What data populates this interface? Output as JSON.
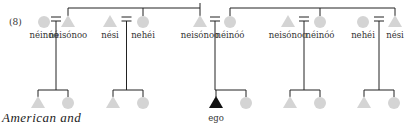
{
  "diagram": {
    "number_label": "(8)",
    "caption": "American and",
    "ego_label": "ego",
    "colors": {
      "symbol": "#d4d4d4",
      "ego": "#111111",
      "line": "#222222"
    },
    "couples": [
      {
        "x": 98,
        "left": {
          "shape": "circle",
          "x": 44,
          "label": "néinóó"
        },
        "right": {
          "shape": "triangle",
          "x": 68,
          "label": "neisónoo"
        }
      },
      {
        "x": 120,
        "left": {
          "shape": "triangle",
          "x": 110,
          "label": "nési"
        },
        "right": {
          "shape": "circle",
          "x": 143,
          "label": "nehéi"
        }
      },
      {
        "x": 216,
        "left": {
          "shape": "triangle",
          "x": 200,
          "label": "neisónoo"
        },
        "right": {
          "shape": "circle",
          "x": 230,
          "label": "néinóó"
        }
      },
      {
        "x": 305,
        "left": {
          "shape": "triangle",
          "x": 288,
          "label": "neisónoo"
        },
        "right": {
          "shape": "circle",
          "x": 320,
          "label": "néinóó"
        }
      },
      {
        "x": 380,
        "left": {
          "shape": "circle",
          "x": 363,
          "label": "nehéi"
        },
        "right": {
          "shape": "triangle",
          "x": 395,
          "label": "nési"
        }
      }
    ],
    "children_groups": [
      {
        "x": 53,
        "children": [
          {
            "shape": "triangle",
            "x": 38
          },
          {
            "shape": "circle",
            "x": 68
          }
        ]
      },
      {
        "x": 127,
        "children": [
          {
            "shape": "triangle",
            "x": 113
          },
          {
            "shape": "circle",
            "x": 143
          }
        ]
      },
      {
        "x": 216,
        "children": [
          {
            "shape": "triangle-ego",
            "x": 216
          },
          {
            "shape": "circle",
            "x": 246
          }
        ]
      },
      {
        "x": 305,
        "children": [
          {
            "shape": "triangle",
            "x": 290
          },
          {
            "shape": "circle",
            "x": 320
          }
        ]
      },
      {
        "x": 380,
        "children": [
          {
            "shape": "triangle",
            "x": 364
          },
          {
            "shape": "circle",
            "x": 394
          }
        ]
      }
    ]
  }
}
